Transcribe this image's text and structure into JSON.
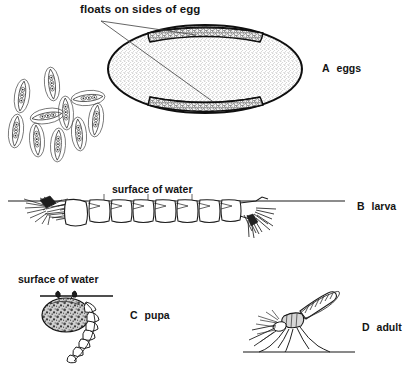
{
  "figure": {
    "annotation": "floats on sides of egg",
    "waterline_label_larva": "surface of water",
    "waterline_label_pupa": "surface of water",
    "stages": [
      {
        "key": "A",
        "letter": "A",
        "name": "eggs"
      },
      {
        "key": "B",
        "letter": "B",
        "name": "larva"
      },
      {
        "key": "C",
        "letter": "C",
        "name": "pupa"
      },
      {
        "key": "D",
        "letter": "D",
        "name": "adult"
      }
    ],
    "colors": {
      "ink": "#141414",
      "line": "#1a1a1a",
      "stipple": "#8d8d8d",
      "float_band": "#2b2b2b",
      "background": "#ffffff"
    },
    "egg_cluster": {
      "count": 10,
      "description": "small eggs with lateral floats, scattered"
    },
    "magnified_egg": {
      "description": "single egg enlarged, stippled body with dark granular float bands top and bottom"
    }
  }
}
